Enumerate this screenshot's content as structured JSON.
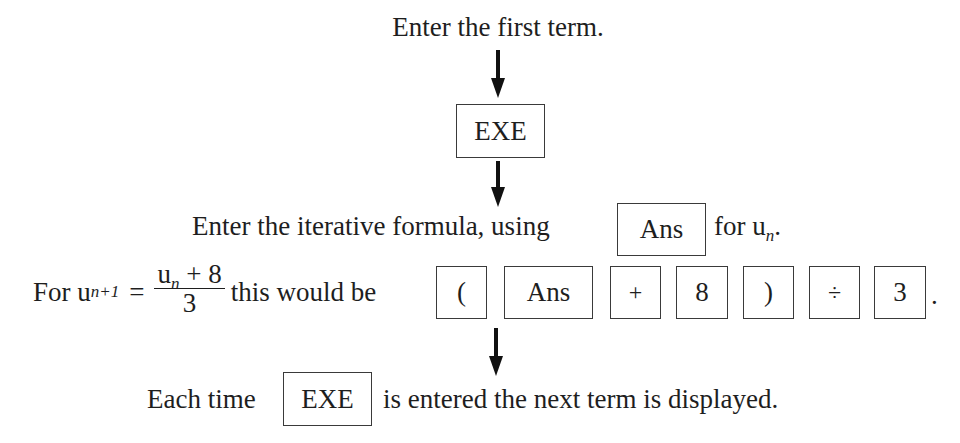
{
  "steps": {
    "step1": "Enter the first term.",
    "exe_key": "EXE",
    "step2_prefix": "Enter the iterative formula, using",
    "ans_key": "Ans",
    "step2_suffix_for": "for u",
    "step2_suffix_sub": "n",
    "step2_suffix_end": ".",
    "example": {
      "for_label": "For u",
      "lhs_sub": "n+1",
      "equals": "=",
      "num_u": "u",
      "num_sub": "n",
      "num_rest": " + 8",
      "den": "3",
      "this_would_be": "this would be",
      "keys": [
        "(",
        "Ans",
        "+",
        "8",
        ")",
        "÷",
        "3"
      ],
      "period": "."
    },
    "step3_prefix": "Each time",
    "step3_key": "EXE",
    "step3_suffix": "is entered the next term is displayed."
  },
  "icons": {
    "arrow": "down-arrow-icon"
  }
}
